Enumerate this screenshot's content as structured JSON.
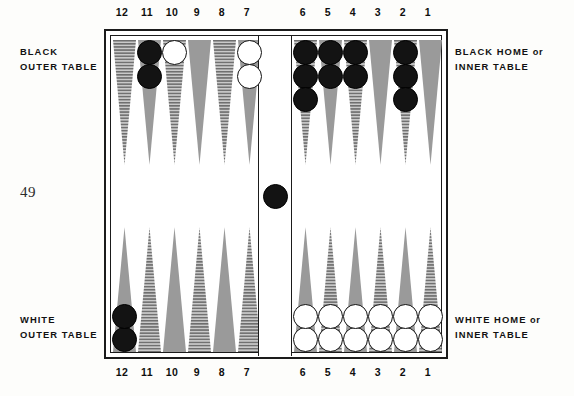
{
  "page": {
    "number": "49"
  },
  "labels": {
    "black_outer_line1": "BLACK",
    "black_outer_line2": "OUTER TABLE",
    "white_outer_line1": "WHITE",
    "white_outer_line2": "OUTER TABLE",
    "black_home_line1_main": "BLACK HOME",
    "black_home_line1_or": "or",
    "black_home_line2": "INNER TABLE",
    "white_home_line1_main": "WHITE HOME",
    "white_home_line1_or": "or",
    "white_home_line2": "INNER TABLE"
  },
  "point_numbers": {
    "top": [
      "12",
      "11",
      "10",
      "9",
      "8",
      "7",
      "6",
      "5",
      "4",
      "3",
      "2",
      "1"
    ],
    "bottom": [
      "12",
      "11",
      "10",
      "9",
      "8",
      "7",
      "6",
      "5",
      "4",
      "3",
      "2",
      "1"
    ]
  },
  "colors": {
    "point_solid": "#9a9a9a",
    "point_hatched_base": "#c9c9c9",
    "point_hatched_line": "#6e6e6e",
    "checker_black": "#131313",
    "checker_white": "#ffffff",
    "frame": "#1b1b1b",
    "surface": "#ffffff",
    "text": "#121212"
  },
  "board": {
    "bar_checkers": [
      {
        "color": "black",
        "count": 1
      }
    ],
    "top_points": [
      {
        "number": "12",
        "quadrant": "black-outer",
        "fill": "hatched",
        "checkers": 0,
        "color": null
      },
      {
        "number": "11",
        "quadrant": "black-outer",
        "fill": "solid",
        "checkers": 2,
        "color": "black"
      },
      {
        "number": "10",
        "quadrant": "black-outer",
        "fill": "hatched",
        "checkers": 1,
        "color": "white"
      },
      {
        "number": "9",
        "quadrant": "black-outer",
        "fill": "solid",
        "checkers": 0,
        "color": null
      },
      {
        "number": "8",
        "quadrant": "black-outer",
        "fill": "hatched",
        "checkers": 0,
        "color": null
      },
      {
        "number": "7",
        "quadrant": "black-outer",
        "fill": "solid",
        "checkers": 2,
        "color": "white"
      },
      {
        "number": "6",
        "quadrant": "black-home",
        "fill": "hatched",
        "checkers": 3,
        "color": "black"
      },
      {
        "number": "5",
        "quadrant": "black-home",
        "fill": "solid",
        "checkers": 2,
        "color": "black"
      },
      {
        "number": "4",
        "quadrant": "black-home",
        "fill": "hatched",
        "checkers": 2,
        "color": "black"
      },
      {
        "number": "3",
        "quadrant": "black-home",
        "fill": "solid",
        "checkers": 0,
        "color": null
      },
      {
        "number": "2",
        "quadrant": "black-home",
        "fill": "hatched",
        "checkers": 3,
        "color": "black"
      },
      {
        "number": "1",
        "quadrant": "black-home",
        "fill": "solid",
        "checkers": 0,
        "color": null
      }
    ],
    "bottom_points": [
      {
        "number": "12",
        "quadrant": "white-outer",
        "fill": "solid",
        "checkers": 2,
        "color": "black"
      },
      {
        "number": "11",
        "quadrant": "white-outer",
        "fill": "hatched",
        "checkers": 0,
        "color": null
      },
      {
        "number": "10",
        "quadrant": "white-outer",
        "fill": "solid",
        "checkers": 0,
        "color": null
      },
      {
        "number": "9",
        "quadrant": "white-outer",
        "fill": "hatched",
        "checkers": 0,
        "color": null
      },
      {
        "number": "8",
        "quadrant": "white-outer",
        "fill": "solid",
        "checkers": 0,
        "color": null
      },
      {
        "number": "7",
        "quadrant": "white-outer",
        "fill": "hatched",
        "checkers": 0,
        "color": null
      },
      {
        "number": "6",
        "quadrant": "white-home",
        "fill": "solid",
        "checkers": 2,
        "color": "white"
      },
      {
        "number": "5",
        "quadrant": "white-home",
        "fill": "hatched",
        "checkers": 2,
        "color": "white"
      },
      {
        "number": "4",
        "quadrant": "white-home",
        "fill": "solid",
        "checkers": 2,
        "color": "white"
      },
      {
        "number": "3",
        "quadrant": "white-home",
        "fill": "hatched",
        "checkers": 2,
        "color": "white"
      },
      {
        "number": "2",
        "quadrant": "white-home",
        "fill": "solid",
        "checkers": 2,
        "color": "white"
      },
      {
        "number": "1",
        "quadrant": "white-home",
        "fill": "hatched",
        "checkers": 2,
        "color": "white"
      }
    ]
  }
}
